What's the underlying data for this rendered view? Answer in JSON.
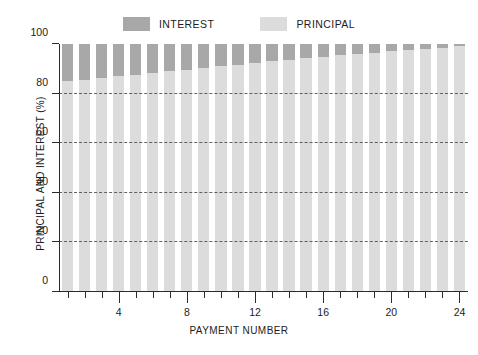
{
  "legend": {
    "position": "top-center",
    "entries": [
      {
        "label": "INTEREST",
        "color": "#a8a8a8",
        "series_key": "interest"
      },
      {
        "label": "PRINCIPAL",
        "color": "#dcdcdc",
        "series_key": "principal"
      }
    ]
  },
  "axes": {
    "y": {
      "title": "PRINCIPAL AND INTEREST (%)",
      "ticks": [
        0,
        20,
        40,
        60,
        80,
        100
      ],
      "tick_labels": [
        "0",
        "20",
        "40",
        "60",
        "80",
        "100"
      ],
      "min": 0,
      "max": 100,
      "gridlines_at": [
        20,
        40,
        60,
        80
      ],
      "grid_style": "dashed"
    },
    "x": {
      "title": "PAYMENT NUMBER",
      "major_ticks": [
        4,
        8,
        12,
        16,
        20,
        24
      ],
      "major_tick_labels": [
        "4",
        "8",
        "12",
        "16",
        "20",
        "24"
      ],
      "minor_ticks_every": 1,
      "min": 1,
      "max": 24
    }
  },
  "chart_data": {
    "type": "bar",
    "stacked": true,
    "stack_total": 100,
    "title": "",
    "subtitle": "",
    "xlabel": "PAYMENT NUMBER",
    "ylabel": "PRINCIPAL AND INTEREST (%)",
    "ylim": [
      0,
      100
    ],
    "xlim": [
      1,
      24
    ],
    "grid": true,
    "legend_position": "top-center",
    "categories": [
      1,
      2,
      3,
      4,
      5,
      6,
      7,
      8,
      9,
      10,
      11,
      12,
      13,
      14,
      15,
      16,
      17,
      18,
      19,
      20,
      21,
      22,
      23,
      24
    ],
    "series": [
      {
        "name": "PRINCIPAL",
        "color": "#dcdcdc",
        "values": [
          85,
          85.6,
          86.3,
          87,
          87.6,
          88.3,
          89,
          89.6,
          90.3,
          91,
          91.6,
          92.3,
          93,
          93.6,
          94.2,
          94.8,
          95.4,
          96,
          96.5,
          97,
          97.5,
          98,
          98.5,
          99
        ]
      },
      {
        "name": "INTEREST",
        "color": "#a8a8a8",
        "values": [
          15,
          14.4,
          13.7,
          13,
          12.4,
          11.7,
          11,
          10.4,
          9.7,
          9,
          8.4,
          7.7,
          7,
          6.4,
          5.8,
          5.2,
          4.6,
          4,
          3.5,
          3,
          2.5,
          2,
          1.5,
          1
        ]
      }
    ]
  },
  "colors": {
    "interest": "#a8a8a8",
    "principal": "#dcdcdc",
    "axis": "#2b2b2b",
    "grid": "#4a4a4a",
    "text": "#1c1c1c",
    "background": "#ffffff"
  }
}
